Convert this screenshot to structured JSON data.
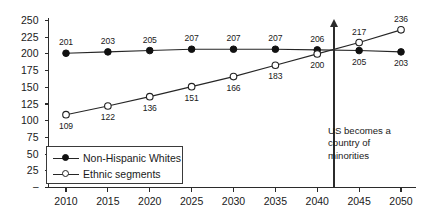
{
  "chart_data": {
    "type": "line",
    "title": "",
    "xlabel": "",
    "ylabel": "",
    "categories": [
      "2010",
      "2015",
      "2020",
      "2025",
      "2030",
      "2035",
      "2040",
      "2045",
      "2050"
    ],
    "x": [
      2010,
      2015,
      2020,
      2025,
      2030,
      2035,
      2040,
      2045,
      2050
    ],
    "xlim": [
      2010,
      2050
    ],
    "ylim": [
      0,
      250
    ],
    "yticks": [
      "",
      "25",
      "50",
      "75",
      "100",
      "125",
      "150",
      "175",
      "200",
      "225",
      "250"
    ],
    "ytick_values": [
      0,
      25,
      50,
      75,
      100,
      125,
      150,
      175,
      200,
      225,
      250
    ],
    "grid": false,
    "legend_position": "inside-bottom-left",
    "series": [
      {
        "name": "Non-Hispanic Whites",
        "marker": "filled-circle",
        "values": [
          201,
          203,
          205,
          207,
          207,
          207,
          206,
          205,
          203
        ],
        "labels": [
          "201",
          "203",
          "205",
          "207",
          "207",
          "207",
          "206",
          "205",
          "203"
        ],
        "label_positions": [
          "above",
          "above",
          "above",
          "above",
          "above",
          "above",
          "above",
          "below",
          "below"
        ]
      },
      {
        "name": "Ethnic segments",
        "marker": "open-circle",
        "values": [
          109,
          122,
          136,
          151,
          166,
          183,
          200,
          217,
          236
        ],
        "labels": [
          "109",
          "122",
          "136",
          "151",
          "166",
          "183",
          "200",
          "217",
          "236"
        ],
        "label_positions": [
          "below",
          "below",
          "below",
          "below",
          "below",
          "below",
          "below",
          "above",
          "above"
        ]
      }
    ],
    "annotations": [
      {
        "name": "crossover-marker",
        "type": "vertical-arrow",
        "x": 2042,
        "text_lines": [
          "US becomes a",
          "country of",
          "minorities"
        ]
      }
    ]
  },
  "legend": {
    "items": [
      {
        "label": "Non-Hispanic Whites",
        "marker": "filled-circle"
      },
      {
        "label": "Ethnic segments",
        "marker": "open-circle"
      }
    ]
  },
  "annotation": {
    "line1": "US becomes a",
    "line2": "country of",
    "line3": "minorities"
  }
}
